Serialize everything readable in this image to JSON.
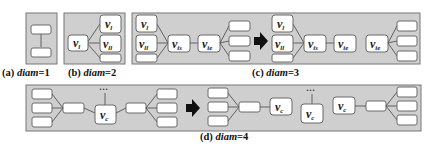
{
  "figure": {
    "panels": [
      {
        "id": "a",
        "caption_prefix": "(a) ",
        "caption_var": "diam",
        "caption_suffix": "=1"
      },
      {
        "id": "b",
        "caption_prefix": "(b) ",
        "caption_var": "diam",
        "caption_suffix": "=2"
      },
      {
        "id": "c",
        "caption_prefix": "(c) ",
        "caption_var": "diam",
        "caption_suffix": "=3"
      },
      {
        "id": "d",
        "caption_prefix": "(d) ",
        "caption_var": "diam",
        "caption_suffix": "=4"
      }
    ],
    "labels": {
      "v": "v",
      "sub_l": "l",
      "sub_ll": "ll",
      "sub_is": "is",
      "sub_ie": "ie",
      "sub_c": "c",
      "ellipsis": "…"
    },
    "colors": {
      "panel_fill": "#cfcfcf",
      "node_fill": "#ffffff",
      "arrow": "#111111"
    }
  }
}
